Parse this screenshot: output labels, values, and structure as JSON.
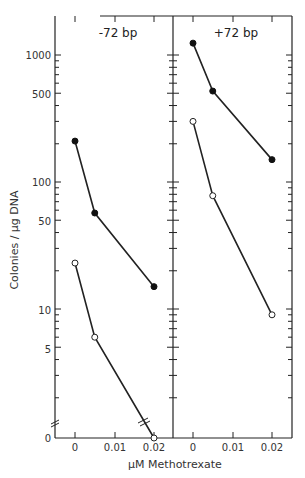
{
  "chart_data": [
    {
      "type": "line",
      "title": "-72 bp",
      "xlabel": "μM Methotrexate",
      "ylabel": "Colonies / μg DNA",
      "yscale": "log (with axis break to 0)",
      "x": [
        0,
        0.005,
        0.02
      ],
      "x_tick_labels": [
        "0",
        "0.01",
        "0.02"
      ],
      "y_tick_labels": [
        "0",
        "5",
        "10",
        "50",
        "100",
        "500",
        "1000"
      ],
      "series": [
        {
          "name": "filled circles",
          "marker": "filled",
          "values": [
            210,
            57,
            15
          ]
        },
        {
          "name": "open circles",
          "marker": "open",
          "values": [
            23,
            6,
            0
          ]
        }
      ],
      "grid": false
    },
    {
      "type": "line",
      "title": "+72 bp",
      "xlabel": "μM Methotrexate",
      "ylabel": "Colonies / μg DNA",
      "yscale": "log",
      "x": [
        0,
        0.005,
        0.02
      ],
      "x_tick_labels": [
        "0",
        "0.01",
        "0.02"
      ],
      "series": [
        {
          "name": "filled circles",
          "marker": "filled",
          "values": [
            1240,
            520,
            150
          ]
        },
        {
          "name": "open circles",
          "marker": "open",
          "values": [
            300,
            78,
            9
          ]
        }
      ],
      "grid": false
    }
  ],
  "labels": {
    "panel_left_title": "-72 bp",
    "panel_right_title": "+72 bp",
    "y_axis_title": "Colonies / μg DNA",
    "x_axis_title": "μM Methotrexate",
    "y_ticks": [
      "1000",
      "500",
      "100",
      "50",
      "10",
      "5",
      "0"
    ],
    "x_ticks_left": [
      "0",
      "0.01",
      "0.02"
    ],
    "x_ticks_right": [
      "0",
      "0.01",
      "0.02"
    ]
  }
}
